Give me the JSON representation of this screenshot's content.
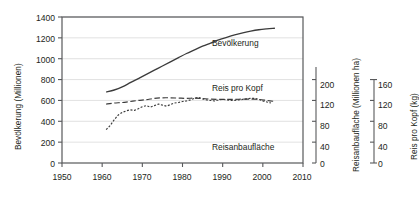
{
  "chart_data": {
    "type": "line",
    "title": "",
    "xlabel": "",
    "ylabel": "Bevölkerung (Millionen)",
    "grid": true,
    "legend_position": "inline-annotations",
    "x_axis": {
      "label": "",
      "ticks": [
        1950,
        1960,
        1970,
        1980,
        1990,
        2000,
        2010
      ],
      "tick_labels": [
        "1950",
        "1960",
        "1970",
        "1980",
        "1990",
        "2000",
        "2010"
      ],
      "xlim": [
        1950,
        2010
      ]
    },
    "y_axes": [
      {
        "id": "left",
        "label": "Bevölkerung (Millionen)",
        "ticks": [
          0,
          200,
          400,
          600,
          800,
          1000,
          1200,
          1400
        ],
        "tick_labels": [
          "0",
          "200",
          "400",
          "600",
          "800",
          "1000",
          "1200",
          "1400"
        ],
        "ylim": [
          0,
          1400
        ]
      },
      {
        "id": "middle",
        "label": "Reisanbaufläche (Millionen ha)",
        "ticks": [
          0,
          40,
          80,
          120,
          200
        ],
        "tick_labels": [
          "0",
          "40",
          "80",
          "120",
          "200"
        ],
        "ylim": [
          0,
          200
        ]
      },
      {
        "id": "right",
        "label": "Reis pro Kopf (kg)",
        "ticks": [
          0,
          40,
          80,
          120,
          160
        ],
        "tick_labels": [
          "0",
          "40",
          "80",
          "120",
          "160"
        ],
        "ylim": [
          0,
          160
        ]
      }
    ],
    "series": [
      {
        "name": "Bevölkerung",
        "axis": "left",
        "style": "solid",
        "unit": "Millionen",
        "x": [
          1961,
          1963,
          1965,
          1967,
          1969,
          1971,
          1973,
          1975,
          1977,
          1979,
          1981,
          1983,
          1985,
          1987,
          1989,
          1991,
          1993,
          1995,
          1997,
          1999,
          2001,
          2003
        ],
        "values": [
          680,
          700,
          730,
          770,
          810,
          850,
          890,
          930,
          970,
          1010,
          1050,
          1085,
          1120,
          1150,
          1180,
          1205,
          1228,
          1248,
          1265,
          1278,
          1286,
          1292
        ]
      },
      {
        "name": "Reis pro Kopf",
        "axis": "right",
        "style": "dotted",
        "unit": "kg",
        "x": [
          1961,
          1962,
          1963,
          1964,
          1965,
          1966,
          1967,
          1968,
          1969,
          1970,
          1971,
          1972,
          1973,
          1974,
          1975,
          1976,
          1977,
          1978,
          1979,
          1980,
          1981,
          1982,
          1983,
          1984,
          1985,
          1986,
          1987,
          1988,
          1989,
          1990,
          1991,
          1992,
          1993,
          1994,
          1995,
          1996,
          1997,
          1998,
          1999,
          2000,
          2001,
          2002
        ],
        "values": [
          64,
          72,
          83,
          92,
          97,
          100,
          102,
          101,
          104,
          108,
          110,
          107,
          110,
          113,
          111,
          109,
          112,
          115,
          116,
          118,
          119,
          121,
          124,
          126,
          123,
          121,
          120,
          119,
          121,
          122,
          121,
          120,
          120,
          121,
          122,
          123,
          124,
          124,
          122,
          119,
          117,
          115
        ]
      },
      {
        "name": "Reisanbaufläche",
        "axis": "middle",
        "style": "dashed",
        "unit": "Millionen ha",
        "x": [
          1961,
          1963,
          1965,
          1967,
          1969,
          1971,
          1973,
          1975,
          1977,
          1979,
          1981,
          1983,
          1985,
          1987,
          1989,
          1991,
          1993,
          1995,
          1997,
          1999,
          2001,
          2003
        ],
        "values": [
          113,
          115,
          116,
          118,
          120,
          123,
          128,
          130,
          130,
          129,
          128,
          129,
          127,
          125,
          124,
          124,
          124,
          125,
          125,
          124,
          120,
          118
        ]
      }
    ],
    "annotations": [
      {
        "text": "Bevölkerung",
        "series": "Bevölkerung"
      },
      {
        "text": "Reis pro Kopf",
        "series": "Reis pro Kopf"
      },
      {
        "text": "Reisanbaufläche",
        "series": "Reisanbaufläche"
      }
    ]
  },
  "axis_titles": {
    "left": "Bevölkerung (Millionen)",
    "middle": "Reisanbaufläche (Millionen ha)",
    "right": "Reis pro Kopf (kg)"
  },
  "left_ticks": [
    "1400",
    "1200",
    "1000",
    "800",
    "600",
    "400",
    "200",
    "0"
  ],
  "middle_ticks": [
    "200",
    "120",
    "80",
    "40",
    "0"
  ],
  "right_ticks": [
    "160",
    "120",
    "80",
    "40",
    "0"
  ],
  "x_ticks": [
    "1950",
    "1960",
    "1970",
    "1980",
    "1990",
    "2000",
    "2010"
  ],
  "series_labels": {
    "population": "Bevölkerung",
    "rice_per_capita": "Reis pro Kopf",
    "rice_area": "Reisanbaufläche"
  },
  "colors": {
    "line": "#3b3b3b",
    "grid": "#d9d9d9",
    "axis": "#58595b",
    "text": "#231f20"
  }
}
